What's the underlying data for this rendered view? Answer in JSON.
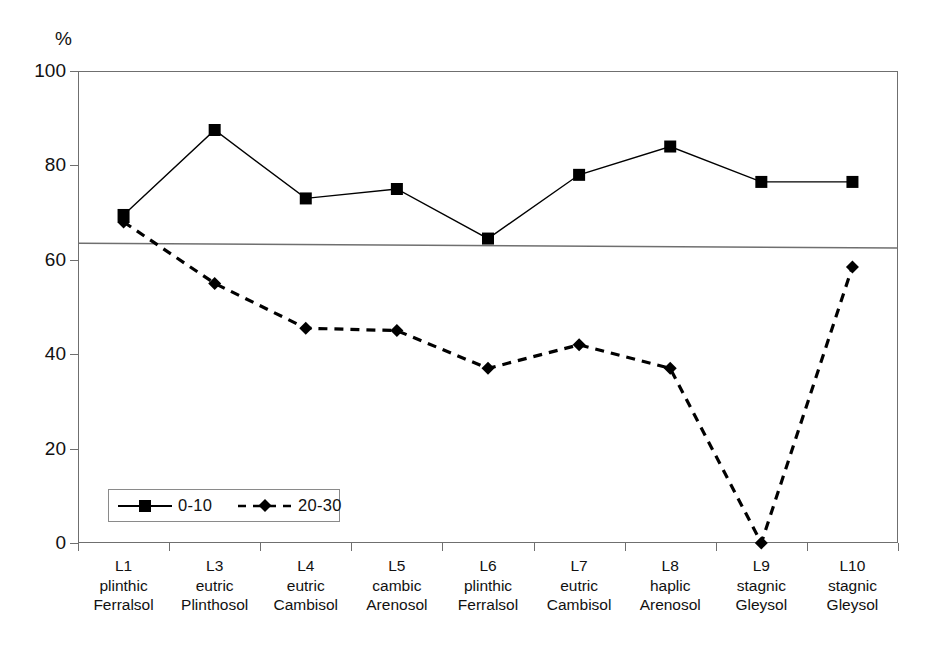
{
  "chart_data": {
    "type": "line",
    "title": "",
    "subtitle": "",
    "xlabel": "",
    "ylabel": "%",
    "ylim": [
      0,
      100
    ],
    "yticks": [
      0,
      20,
      40,
      60,
      80,
      100
    ],
    "grid": false,
    "legend_position": "inside-bottom-left",
    "categories": [
      "L1 plinthic Ferralsol",
      "L3 eutric Plinthosol",
      "L4 eutric Cambisol",
      "L5 cambic Arenosol",
      "L6 plinthic Ferralsol",
      "L7 eutric Cambisol",
      "L8 haplic Arenosol",
      "L9 stagnic Gleysol",
      "L10 stagnic Gleysol"
    ],
    "category_lines": [
      [
        "L1",
        "plinthic",
        "Ferralsol"
      ],
      [
        "L3",
        "eutric",
        "Plinthosol"
      ],
      [
        "L4",
        "eutric",
        "Cambisol"
      ],
      [
        "L5",
        "cambic",
        "Arenosol"
      ],
      [
        "L6",
        "plinthic",
        "Ferralsol"
      ],
      [
        "L7",
        "eutric",
        "Cambisol"
      ],
      [
        "L8",
        "haplic",
        "Arenosol"
      ],
      [
        "L9",
        "stagnic",
        "Gleysol"
      ],
      [
        "L10",
        "stagnic",
        "Gleysol"
      ]
    ],
    "series": [
      {
        "name": "0-10",
        "marker": "square",
        "linestyle": "solid",
        "color": "#000000",
        "values": [
          69.5,
          87.5,
          73.0,
          75.0,
          64.5,
          78.0,
          84.0,
          76.5,
          76.5
        ]
      },
      {
        "name": "20-30",
        "marker": "diamond",
        "linestyle": "dashed",
        "color": "#000000",
        "values": [
          68.0,
          55.0,
          45.5,
          45.0,
          37.0,
          42.0,
          37.0,
          0.0,
          58.5
        ]
      }
    ],
    "trendline": {
      "name": "trend",
      "linestyle": "solid",
      "color": "#6f6f6f",
      "start_value": 63.5,
      "end_value": 62.5
    }
  },
  "axes": {
    "y_unit": "%",
    "y_tick_labels": [
      "100",
      "80",
      "60",
      "40",
      "20",
      "0"
    ]
  },
  "legend": {
    "entries": [
      {
        "label": "0-10",
        "marker": "square",
        "linestyle": "solid"
      },
      {
        "label": "20-30",
        "marker": "diamond",
        "linestyle": "dashed"
      }
    ]
  }
}
